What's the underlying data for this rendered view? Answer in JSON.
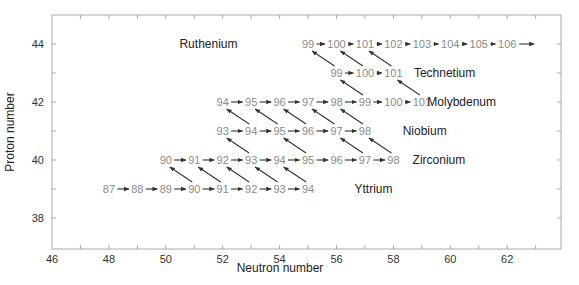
{
  "chart_data": {
    "type": "diagram",
    "title": "",
    "xlabel": "Neutron number",
    "ylabel": "Proton number",
    "xlim": [
      46,
      64
    ],
    "ylim": [
      37,
      45
    ],
    "xticks": [
      46,
      48,
      50,
      52,
      54,
      56,
      58,
      60,
      62
    ],
    "yticks": [
      38,
      40,
      42,
      44
    ],
    "grid": false,
    "colors": {
      "axis": "#aaaaaa",
      "nuclide_text": "#8a8a8a",
      "arrow": "#333333",
      "label": "#222222"
    },
    "elements": [
      {
        "name": "Yttrium",
        "Z": 39,
        "mass_numbers": [
          87,
          88,
          89,
          90,
          91,
          92,
          93,
          94
        ],
        "label_N": 57.3
      },
      {
        "name": "Zirconium",
        "Z": 40,
        "mass_numbers": [
          90,
          91,
          92,
          93,
          94,
          95,
          96,
          97,
          98
        ],
        "label_N": 59.6
      },
      {
        "name": "Niobium",
        "Z": 41,
        "mass_numbers": [
          93,
          94,
          95,
          96,
          97,
          98
        ],
        "label_N": 59.1
      },
      {
        "name": "Molybdenum",
        "Z": 42,
        "mass_numbers": [
          94,
          95,
          96,
          97,
          98,
          99,
          100,
          101
        ],
        "label_N": 60.4
      },
      {
        "name": "Technetium",
        "Z": 43,
        "mass_numbers": [
          99,
          100,
          101
        ],
        "label_N": 59.8
      },
      {
        "name": "Ruthenium",
        "Z": 44,
        "mass_numbers": [
          99,
          100,
          101,
          102,
          103,
          104,
          105,
          106
        ],
        "label_N": 51.5
      }
    ],
    "beta_decays": [
      {
        "from_Z": 39,
        "to_Z": 40,
        "A": [
          90,
          91,
          92,
          93,
          94
        ]
      },
      {
        "from_Z": 40,
        "to_Z": 41,
        "A": [
          93,
          95,
          97,
          98
        ]
      },
      {
        "from_Z": 41,
        "to_Z": 42,
        "A": [
          94,
          95,
          96,
          97,
          98
        ]
      },
      {
        "from_Z": 42,
        "to_Z": 43,
        "A": [
          99,
          101
        ]
      },
      {
        "from_Z": 43,
        "to_Z": 44,
        "A": [
          99,
          100,
          101
        ]
      }
    ],
    "trailing_arrow": {
      "Z": 44,
      "after_A": 106
    }
  }
}
